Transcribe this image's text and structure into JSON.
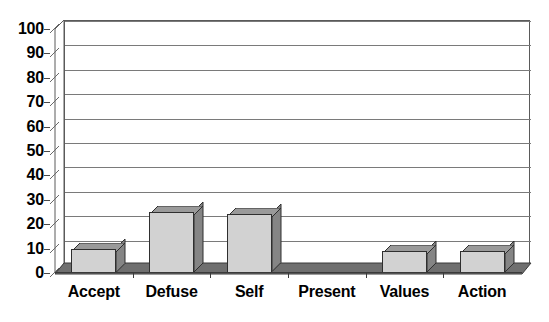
{
  "chart_data": {
    "type": "bar",
    "title": "",
    "subtitle": "",
    "xlabel": "",
    "ylabel": "",
    "categories": [
      "Accept",
      "Defuse",
      "Self",
      "Present",
      "Values",
      "Action"
    ],
    "values": [
      10,
      25,
      24,
      0,
      9,
      9
    ],
    "series": [
      {
        "name": "",
        "values": [
          10,
          25,
          24,
          0,
          9,
          9
        ]
      }
    ],
    "ylim": [
      0,
      100
    ],
    "ytick_labels": [
      "0",
      "10",
      "20",
      "30",
      "40",
      "50",
      "60",
      "70",
      "80",
      "90",
      "100"
    ],
    "ytick_values": [
      0,
      10,
      20,
      30,
      40,
      50,
      60,
      70,
      80,
      90,
      100
    ],
    "grid": true,
    "grid_axis": "y",
    "legend": false,
    "legend_position": "none",
    "style": "3d-column",
    "annotations": [],
    "colors": {
      "bar_front": "#d2d2d2",
      "bar_side": "#858585",
      "bar_top": "#9a9a9a",
      "bar_outline": "#2f2f2f",
      "gridline": "#7a7a7a",
      "axis": "#3a3a3a",
      "background": "#ffffff",
      "text": "#000000"
    }
  }
}
